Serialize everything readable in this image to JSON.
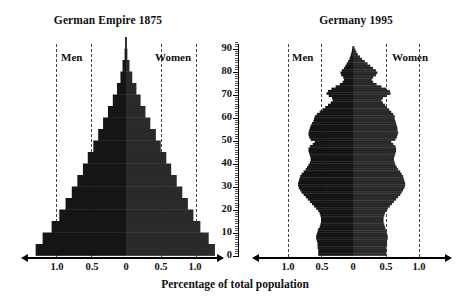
{
  "chart_data": {
    "type": "bar",
    "xlabel": "Percentage of total population",
    "ylabel": "Age",
    "xlim": [
      -1.4,
      1.4
    ],
    "ylim": [
      0,
      95
    ],
    "grid": true,
    "gridline_values": [
      -1.0,
      -0.5,
      0.5,
      1.0
    ],
    "x_tick_labels": [
      "1.0",
      "0.5",
      "0",
      "0.5",
      "1.0"
    ],
    "x_tick_values": [
      -1.0,
      -0.5,
      0,
      0.5,
      1.0
    ],
    "y_tick_labels": [
      "0",
      "10",
      "20",
      "30",
      "40",
      "50",
      "60",
      "70",
      "80",
      "90"
    ],
    "y_tick_values": [
      0,
      10,
      20,
      30,
      40,
      50,
      60,
      70,
      80,
      90
    ],
    "legend_position": "inside-top",
    "panels": [
      {
        "title": "German Empire 1875",
        "men_label": "Men",
        "women_label": "Women",
        "age_bin_size": 5,
        "age_bins": [
          0,
          5,
          10,
          15,
          20,
          25,
          30,
          35,
          40,
          45,
          50,
          55,
          60,
          65,
          70,
          75,
          80,
          85,
          90
        ],
        "men_values": [
          1.3,
          1.2,
          1.07,
          0.96,
          0.87,
          0.78,
          0.7,
          0.62,
          0.55,
          0.47,
          0.4,
          0.33,
          0.26,
          0.19,
          0.13,
          0.08,
          0.05,
          0.02,
          0.01
        ],
        "women_values": [
          1.28,
          1.19,
          1.07,
          0.97,
          0.89,
          0.81,
          0.73,
          0.65,
          0.58,
          0.5,
          0.43,
          0.35,
          0.28,
          0.21,
          0.15,
          0.09,
          0.05,
          0.02,
          0.01
        ]
      },
      {
        "title": "Germany 1995",
        "men_label": "Men",
        "women_label": "Women",
        "age_bin_size": 1,
        "age_bins": [
          0,
          1,
          2,
          3,
          4,
          5,
          6,
          7,
          8,
          9,
          10,
          11,
          12,
          13,
          14,
          15,
          16,
          17,
          18,
          19,
          20,
          21,
          22,
          23,
          24,
          25,
          26,
          27,
          28,
          29,
          30,
          31,
          32,
          33,
          34,
          35,
          36,
          37,
          38,
          39,
          40,
          41,
          42,
          43,
          44,
          45,
          46,
          47,
          48,
          49,
          50,
          51,
          52,
          53,
          54,
          55,
          56,
          57,
          58,
          59,
          60,
          61,
          62,
          63,
          64,
          65,
          66,
          67,
          68,
          69,
          70,
          71,
          72,
          73,
          74,
          75,
          76,
          77,
          78,
          79,
          80,
          81,
          82,
          83,
          84,
          85,
          86,
          87,
          88,
          89,
          90
        ],
        "men_values": [
          0.5,
          0.5,
          0.5,
          0.51,
          0.51,
          0.51,
          0.52,
          0.53,
          0.53,
          0.52,
          0.51,
          0.5,
          0.48,
          0.47,
          0.46,
          0.46,
          0.46,
          0.47,
          0.48,
          0.5,
          0.53,
          0.56,
          0.59,
          0.62,
          0.65,
          0.68,
          0.71,
          0.74,
          0.76,
          0.78,
          0.79,
          0.79,
          0.78,
          0.77,
          0.76,
          0.74,
          0.71,
          0.68,
          0.66,
          0.64,
          0.62,
          0.61,
          0.61,
          0.62,
          0.63,
          0.64,
          0.64,
          0.62,
          0.58,
          0.55,
          0.61,
          0.63,
          0.64,
          0.64,
          0.63,
          0.62,
          0.61,
          0.59,
          0.57,
          0.56,
          0.55,
          0.52,
          0.48,
          0.44,
          0.4,
          0.36,
          0.32,
          0.29,
          0.3,
          0.35,
          0.38,
          0.36,
          0.31,
          0.25,
          0.19,
          0.15,
          0.13,
          0.14,
          0.17,
          0.18,
          0.16,
          0.13,
          0.11,
          0.09,
          0.07,
          0.05,
          0.04,
          0.03,
          0.02,
          0.015,
          0.01
        ],
        "women_values": [
          0.48,
          0.48,
          0.48,
          0.48,
          0.49,
          0.49,
          0.49,
          0.5,
          0.5,
          0.49,
          0.48,
          0.47,
          0.46,
          0.45,
          0.44,
          0.44,
          0.44,
          0.45,
          0.46,
          0.48,
          0.5,
          0.53,
          0.56,
          0.59,
          0.62,
          0.65,
          0.68,
          0.7,
          0.72,
          0.74,
          0.75,
          0.75,
          0.74,
          0.73,
          0.72,
          0.7,
          0.68,
          0.65,
          0.63,
          0.61,
          0.6,
          0.59,
          0.59,
          0.6,
          0.61,
          0.62,
          0.62,
          0.61,
          0.58,
          0.55,
          0.61,
          0.63,
          0.64,
          0.65,
          0.64,
          0.64,
          0.63,
          0.62,
          0.61,
          0.6,
          0.6,
          0.58,
          0.55,
          0.52,
          0.49,
          0.46,
          0.43,
          0.41,
          0.43,
          0.49,
          0.54,
          0.53,
          0.48,
          0.41,
          0.34,
          0.29,
          0.27,
          0.29,
          0.33,
          0.35,
          0.33,
          0.29,
          0.25,
          0.21,
          0.17,
          0.13,
          0.1,
          0.07,
          0.05,
          0.035,
          0.02
        ]
      }
    ]
  },
  "panel_left": {
    "title": "German Empire 1875",
    "men_label": "Men",
    "women_label": "Women"
  },
  "panel_right": {
    "title": "Germany 1995",
    "men_label": "Men",
    "women_label": "Women"
  },
  "axis": {
    "caption": "Percentage of total population",
    "x_labels_left": [
      "1.0",
      "0.5",
      "0",
      "0.5",
      "1.0"
    ],
    "x_labels_right": [
      "1.0",
      "0.5",
      "0",
      "0.5",
      "1.0"
    ],
    "y_labels": [
      "90",
      "80",
      "70",
      "60",
      "50",
      "40",
      "30",
      "20",
      "10",
      "0"
    ]
  },
  "colors": {
    "men_bar": "#151515",
    "women_bar": "#2a2a2a",
    "gridline": "#444444",
    "axis": "#000000",
    "background": "#ffffff"
  }
}
